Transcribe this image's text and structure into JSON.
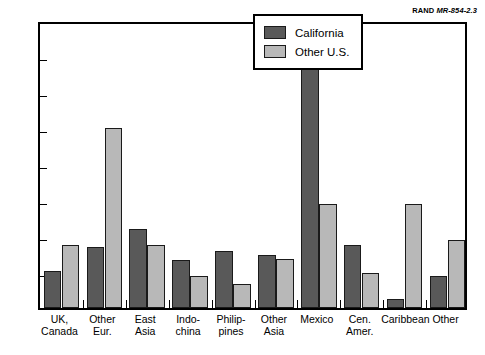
{
  "credit": {
    "org": "RAND",
    "doc": "MR-854-2.3"
  },
  "legend": {
    "items": [
      {
        "label": "California",
        "color": "#595959",
        "key": "ca"
      },
      {
        "label": "Other U.S.",
        "color": "#b8b8b8",
        "key": "us"
      }
    ]
  },
  "chart_data": {
    "type": "bar",
    "title": "",
    "xlabel": "",
    "ylabel": "Percentage of immigrants",
    "ylim": [
      0,
      40
    ],
    "yticks": [
      0,
      5,
      10,
      15,
      20,
      25,
      30,
      35,
      40
    ],
    "ytick_labels": [
      "0",
      "5",
      "10",
      "15",
      "20",
      "25",
      "30",
      "35",
      "40"
    ],
    "grid": false,
    "legend_position": "top-right-inside",
    "categories": [
      "UK, Canada",
      "Other Eur.",
      "East Asia",
      "Indo-china",
      "Philip-pines",
      "Other Asia",
      "Mexico",
      "Cen. Amer.",
      "Caribbean",
      "Other"
    ],
    "category_lines": [
      [
        "UK,",
        "Canada"
      ],
      [
        "Other",
        "Eur."
      ],
      [
        "East",
        "Asia"
      ],
      [
        "Indo-",
        "china"
      ],
      [
        "Philip-",
        "pines"
      ],
      [
        "Other",
        "Asia"
      ],
      [
        "Mexico"
      ],
      [
        "Cen.",
        "Amer."
      ],
      [
        "Caribbean"
      ],
      [
        "Other"
      ]
    ],
    "series": [
      {
        "name": "California",
        "color": "#595959",
        "values": [
          5.1,
          8.5,
          11.0,
          6.6,
          7.9,
          7.3,
          39.8,
          8.8,
          1.3,
          4.5
        ]
      },
      {
        "name": "Other U.S.",
        "color": "#b8b8b8",
        "values": [
          8.7,
          25.0,
          8.7,
          4.4,
          3.3,
          6.8,
          14.4,
          4.8,
          14.5,
          9.4
        ]
      }
    ]
  }
}
